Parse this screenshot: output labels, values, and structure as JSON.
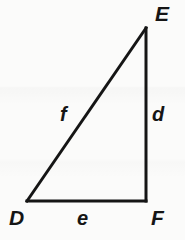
{
  "figure": {
    "kind": "geometry-diagram",
    "shape": "right-triangle",
    "name": "Triangle DEF",
    "background_color": "#fbfbfa",
    "stroke_color": "#151515",
    "stroke_width": 3,
    "width": 185,
    "height": 240,
    "vertices": [
      {
        "id": "D",
        "label": "D",
        "x": 27,
        "y": 201,
        "label_x": 9,
        "label_y": 207
      },
      {
        "id": "E",
        "label": "E",
        "x": 146,
        "y": 28,
        "label_x": 155,
        "label_y": 3
      },
      {
        "id": "F",
        "label": "F",
        "x": 146,
        "y": 201,
        "label_x": 151,
        "label_y": 207
      }
    ],
    "sides": [
      {
        "id": "f",
        "label": "f",
        "from": "D",
        "to": "E",
        "role": "hypotenuse",
        "label_x": 60,
        "label_y": 104
      },
      {
        "id": "d",
        "label": "d",
        "from": "E",
        "to": "F",
        "role": "vertical-leg",
        "label_x": 152,
        "label_y": 104
      },
      {
        "id": "e",
        "label": "e",
        "from": "D",
        "to": "F",
        "role": "base-leg",
        "label_x": 77,
        "label_y": 208
      }
    ],
    "right_angle_at": "F"
  }
}
